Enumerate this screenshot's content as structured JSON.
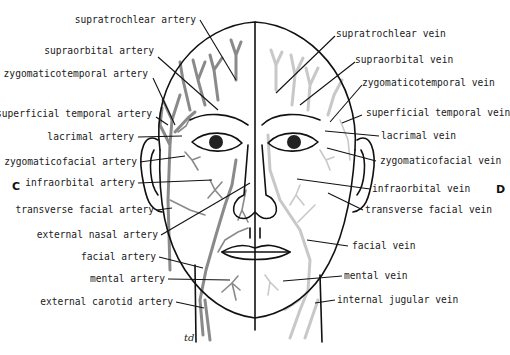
{
  "panels": {
    "left": "C",
    "right": "D"
  },
  "signature": "td",
  "colors": {
    "artery": "#8a8a8a",
    "vein": "#c8c8c8",
    "outline": "#111111"
  },
  "artery_labels": [
    "supratrochlear artery",
    "supraorbital artery",
    "zygomaticotemporal artery",
    "superficial temporal artery",
    "lacrimal artery",
    "zygomaticofacial artery",
    "infraorbital artery",
    "transverse facial artery",
    "external nasal artery",
    "facial artery",
    "mental artery",
    "external carotid artery"
  ],
  "vein_labels": [
    "supratrochlear vein",
    "supraorbital vein",
    "zygomaticotemporal vein",
    "superficial temporal vein",
    "lacrimal vein",
    "zygomaticofacial vein",
    "infraorbital vein",
    "transverse facial vein",
    "facial vein",
    "mental vein",
    "internal jugular vein"
  ]
}
